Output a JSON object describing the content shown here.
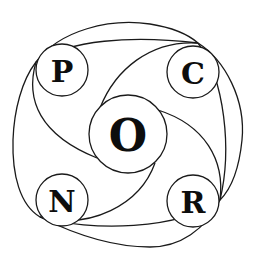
{
  "diagram": {
    "type": "pinwheel-circle-diagram",
    "background": "#ffffff",
    "stroke_color": "#1a1a1a",
    "nodes": [
      {
        "id": "P",
        "label": "P",
        "position": "top-left",
        "cx": 62,
        "cy": 70,
        "r": 26,
        "font_size": 30
      },
      {
        "id": "C",
        "label": "C",
        "position": "top-right",
        "cx": 193,
        "cy": 72,
        "r": 26,
        "font_size": 30
      },
      {
        "id": "O",
        "label": "O",
        "position": "center",
        "cx": 128,
        "cy": 134,
        "r": 39,
        "font_size": 44
      },
      {
        "id": "N",
        "label": "N",
        "position": "bottom-left",
        "cx": 62,
        "cy": 200,
        "r": 26,
        "font_size": 30
      },
      {
        "id": "R",
        "label": "R",
        "position": "bottom-right",
        "cx": 193,
        "cy": 201,
        "r": 26,
        "font_size": 30
      }
    ],
    "connections": [
      {
        "from": "P",
        "to": "O",
        "style": "curved-arc"
      },
      {
        "from": "C",
        "to": "O",
        "style": "curved-arc"
      },
      {
        "from": "R",
        "to": "O",
        "style": "curved-arc"
      },
      {
        "from": "N",
        "to": "O",
        "style": "curved-arc"
      }
    ],
    "outer_boundary": "closed rounded-square curve passing tangent to P, C, R, N"
  }
}
